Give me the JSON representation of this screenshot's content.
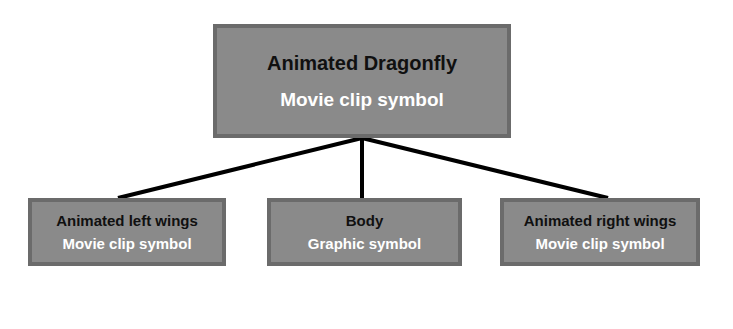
{
  "diagram": {
    "type": "hierarchy-tree",
    "background_color": "#ffffff",
    "node_fill_color": "#8a8a8a",
    "node_border_color": "#6b6b6b",
    "title_text_color": "#101010",
    "subtitle_text_color": "#ffffff",
    "connector_color": "#000000",
    "root": {
      "title": "Animated Dragonfly",
      "subtitle": "Movie clip symbol"
    },
    "children": [
      {
        "title": "Animated left wings",
        "subtitle": "Movie clip symbol"
      },
      {
        "title": "Body",
        "subtitle": "Graphic symbol"
      },
      {
        "title": "Animated right wings",
        "subtitle": "Movie clip symbol"
      }
    ]
  }
}
